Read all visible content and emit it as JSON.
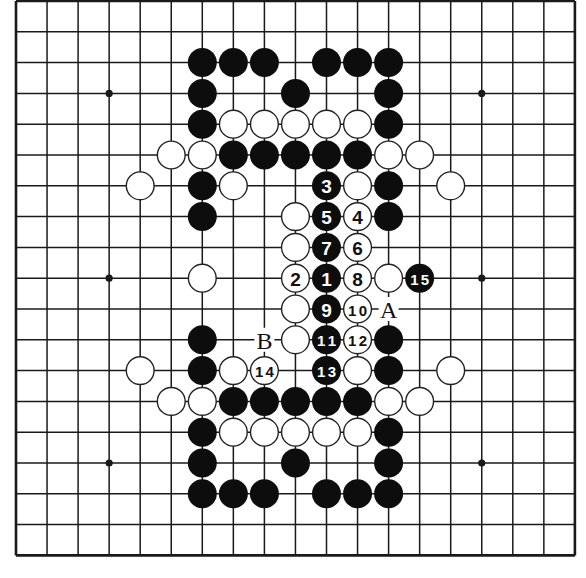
{
  "board": {
    "size": 19,
    "origin": [
      16,
      1
    ],
    "spacing": [
      31.05,
      30.8
    ],
    "line_color": "#1a1a1a",
    "edge_width": 2.6,
    "line_width": 1.5,
    "stone_radius": 14.5,
    "black_color": "#0d0d0d",
    "white_fill": "#ffffff",
    "white_stroke": "#222222",
    "star_points": [
      [
        3,
        3
      ],
      [
        9,
        3
      ],
      [
        15,
        3
      ],
      [
        3,
        9
      ],
      [
        15,
        9
      ],
      [
        3,
        15
      ],
      [
        9,
        15
      ],
      [
        15,
        15
      ]
    ],
    "star_visible": [
      [
        3,
        3
      ],
      [
        15,
        3
      ],
      [
        3,
        9
      ],
      [
        15,
        9
      ],
      [
        3,
        15
      ],
      [
        15,
        15
      ]
    ]
  },
  "stones": {
    "black": [
      [
        6,
        2
      ],
      [
        7,
        2
      ],
      [
        8,
        2
      ],
      [
        10,
        2
      ],
      [
        11,
        2
      ],
      [
        12,
        2
      ],
      [
        6,
        3
      ],
      [
        9,
        3
      ],
      [
        12,
        3
      ],
      [
        6,
        4
      ],
      [
        12,
        4
      ],
      [
        7,
        5
      ],
      [
        8,
        5
      ],
      [
        9,
        5
      ],
      [
        10,
        5
      ],
      [
        11,
        5
      ],
      [
        6,
        6
      ],
      [
        12,
        6
      ],
      [
        6,
        7
      ],
      [
        12,
        7
      ],
      [
        6,
        11
      ],
      [
        12,
        11
      ],
      [
        6,
        12
      ],
      [
        12,
        12
      ],
      [
        7,
        13
      ],
      [
        8,
        13
      ],
      [
        9,
        13
      ],
      [
        10,
        13
      ],
      [
        11,
        13
      ],
      [
        6,
        14
      ],
      [
        12,
        14
      ],
      [
        6,
        15
      ],
      [
        9,
        15
      ],
      [
        12,
        15
      ],
      [
        6,
        16
      ],
      [
        7,
        16
      ],
      [
        8,
        16
      ],
      [
        10,
        16
      ],
      [
        11,
        16
      ],
      [
        12,
        16
      ]
    ],
    "white": [
      [
        7,
        4
      ],
      [
        8,
        4
      ],
      [
        9,
        4
      ],
      [
        10,
        4
      ],
      [
        11,
        4
      ],
      [
        5,
        5
      ],
      [
        6,
        5
      ],
      [
        12,
        5
      ],
      [
        13,
        5
      ],
      [
        4,
        6
      ],
      [
        7,
        6
      ],
      [
        11,
        6
      ],
      [
        14,
        6
      ],
      [
        9,
        7
      ],
      [
        9,
        8
      ],
      [
        6,
        9
      ],
      [
        12,
        9
      ],
      [
        9,
        10
      ],
      [
        9,
        11
      ],
      [
        4,
        12
      ],
      [
        7,
        12
      ],
      [
        11,
        12
      ],
      [
        14,
        12
      ],
      [
        5,
        13
      ],
      [
        6,
        13
      ],
      [
        12,
        13
      ],
      [
        13,
        13
      ],
      [
        7,
        14
      ],
      [
        8,
        14
      ],
      [
        9,
        14
      ],
      [
        10,
        14
      ],
      [
        11,
        14
      ]
    ]
  },
  "moves": [
    {
      "n": "1",
      "color": "black",
      "pos": [
        10,
        9
      ]
    },
    {
      "n": "2",
      "color": "white",
      "pos": [
        9,
        9
      ]
    },
    {
      "n": "3",
      "color": "black",
      "pos": [
        10,
        6
      ]
    },
    {
      "n": "4",
      "color": "white",
      "pos": [
        11,
        7
      ]
    },
    {
      "n": "5",
      "color": "black",
      "pos": [
        10,
        7
      ]
    },
    {
      "n": "6",
      "color": "white",
      "pos": [
        11,
        8
      ]
    },
    {
      "n": "7",
      "color": "black",
      "pos": [
        10,
        8
      ]
    },
    {
      "n": "8",
      "color": "white",
      "pos": [
        11,
        9
      ]
    },
    {
      "n": "9",
      "color": "black",
      "pos": [
        10,
        10
      ]
    },
    {
      "n": "10",
      "color": "white",
      "pos": [
        11,
        10
      ]
    },
    {
      "n": "11",
      "color": "black",
      "pos": [
        10,
        11
      ]
    },
    {
      "n": "12",
      "color": "white",
      "pos": [
        11,
        11
      ]
    },
    {
      "n": "13",
      "color": "black",
      "pos": [
        10,
        12
      ]
    },
    {
      "n": "14",
      "color": "white",
      "pos": [
        8,
        12
      ]
    },
    {
      "n": "15",
      "color": "black",
      "pos": [
        13,
        9
      ]
    }
  ],
  "labels": [
    {
      "text": "A",
      "pos": [
        12,
        10
      ]
    },
    {
      "text": "B",
      "pos": [
        8,
        11
      ]
    }
  ]
}
